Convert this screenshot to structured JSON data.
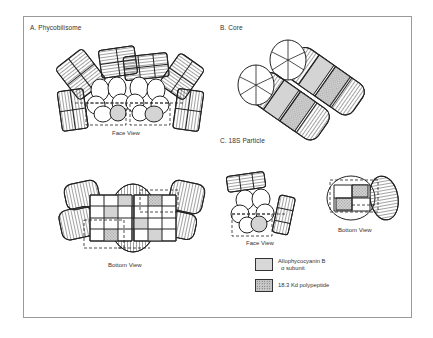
{
  "figure": {
    "panels": [
      {
        "id": "A",
        "title": "A.  Phycobilisome",
        "views": [
          "Face View",
          "Bottom View"
        ]
      },
      {
        "id": "B",
        "title": "B.  Core",
        "views": []
      },
      {
        "id": "C",
        "title": "C. 18S Particle",
        "views": [
          "Face View",
          "Bottom View"
        ]
      }
    ],
    "legend": [
      {
        "label_line1": "Allophycocyanin B",
        "label_line2": "α subunit",
        "fill": "#d8d8d8",
        "pattern": "solid-gray"
      },
      {
        "label_line1": "18.3 Kd polypeptide",
        "label_line2": "",
        "fill": "#c8c8c8",
        "pattern": "stippled"
      }
    ],
    "colors": {
      "line": "#222222",
      "shade": "#d4d4d4",
      "stipple": "#bdbdbd",
      "frame": "#9a9a9a"
    }
  }
}
